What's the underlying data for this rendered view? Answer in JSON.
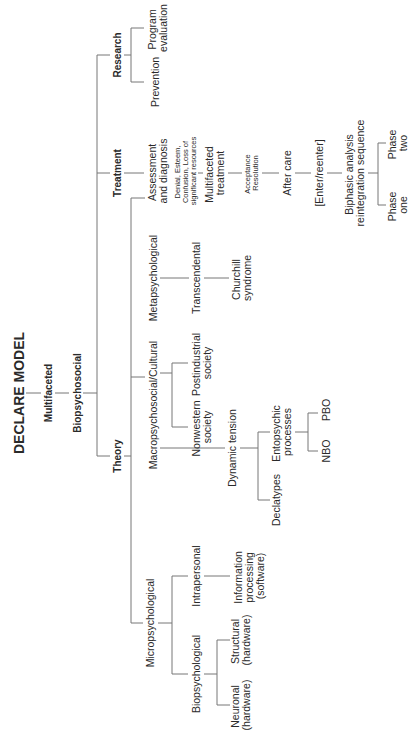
{
  "diagram": {
    "title": "DECLARE MODEL",
    "subtitle1": "Multifaceted",
    "subtitle2": "Biopsychosocial",
    "branches": {
      "research": {
        "label": "Research",
        "children": {
          "program_evaluation": [
            "Program",
            "evaluation"
          ],
          "prevention": "Prevention"
        }
      },
      "treatment": {
        "label": "Treatment",
        "assessment": [
          "Assessment",
          "and diagnosis"
        ],
        "assessment_notes": [
          "Denial, Esteem,",
          "Confusion, Loss of",
          "significant resources"
        ],
        "multifaceted_treatment": [
          "Multifaceted",
          "treatment"
        ],
        "multifaceted_notes": [
          "Acceptance",
          "Resolution"
        ],
        "after_care": "After care",
        "enter_reenter": "[Enter/reenter]",
        "biphasic": [
          "Biphasic analysis",
          "reintegration sequence"
        ],
        "phase_two": [
          "Phase",
          "two"
        ],
        "phase_one": [
          "Phase",
          "one"
        ]
      },
      "theory": {
        "label": "Theory",
        "metapsychological": {
          "label": "Metapsychological",
          "transcendental": "Transcendental",
          "churchill": [
            "Churchill",
            "syndrome"
          ]
        },
        "macropsychosocial": {
          "label": "Macropsychosocial/Cultural",
          "postindustrial": [
            "Postindustrial",
            "society"
          ],
          "nonwestern": [
            "Nonwestern",
            "society"
          ],
          "dynamic_tension": "Dynamic tension",
          "entopsychic": [
            "Entopsychic",
            "processes"
          ],
          "pbo": "PBO",
          "nbo": "NBO",
          "declatypes": "Declatypes"
        },
        "micropsychological": {
          "label": "Micropsychological",
          "intrapersonal": "Intrapersonal",
          "information_processing": [
            "Information",
            "processing",
            "(software)"
          ],
          "biopsychological": "Biopsychological",
          "structural": [
            "Structural",
            "(hardware)"
          ],
          "neuronal": [
            "Neuronal",
            "(hardware)"
          ]
        }
      }
    }
  }
}
